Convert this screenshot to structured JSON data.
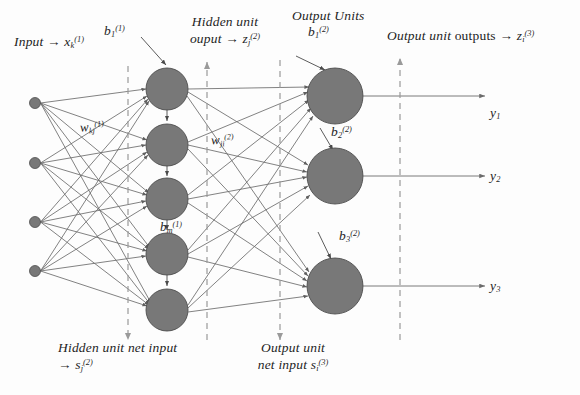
{
  "diagram": {
    "colors": {
      "node_fill": "#787878",
      "node_stroke": "#4d4d4d",
      "edge": "#6b6b6b",
      "dashed_guide": "#9a9a9a",
      "text": "#1d1d1d",
      "background": "#fdfdfd"
    },
    "labels": {
      "input": {
        "text_plain": "Input → x",
        "lead": "Input",
        "arrow": "→",
        "symbol": "x",
        "sub": "k",
        "sup": "(1)"
      },
      "hidden_bias_first": {
        "symbol": "b",
        "sub": "1",
        "sup": "(1)"
      },
      "hidden_bias_last": {
        "symbol": "b",
        "sub": "m",
        "sup": "(1)"
      },
      "hidden_output": {
        "line1": "Hidden unit",
        "line2_lead": "ouput",
        "arrow": "→",
        "symbol": "z",
        "sub": "j",
        "sup": "(2)"
      },
      "weights_input_hidden": {
        "symbol": "w",
        "sub": "kj",
        "sup": "(1)"
      },
      "weights_hidden_output": {
        "symbol": "w",
        "sub": "ji",
        "sup": "(2)"
      },
      "output_units_heading": "Output Units",
      "output_bias_1": {
        "symbol": "b",
        "sub": "1",
        "sup": "(2)"
      },
      "output_bias_2": {
        "symbol": "b",
        "sub": "2",
        "sup": "(2)"
      },
      "output_bias_3": {
        "symbol": "b",
        "sub": "3",
        "sup": "(2)"
      },
      "output_unit_outputs": {
        "lead": "Output unit",
        "word": "outputs",
        "arrow": "→",
        "symbol": "z",
        "sub": "i",
        "sup": "(3)"
      },
      "hidden_net_input": {
        "line1": "Hidden unit net input",
        "arrow": "→",
        "symbol": "s",
        "sub": "j",
        "sup": "(2)"
      },
      "output_net_input": {
        "line1": "Output unit",
        "line2": "net input",
        "symbol": "s",
        "sub": "i",
        "sup": "(3)"
      },
      "y1": {
        "symbol": "y",
        "sub": "1"
      },
      "y2": {
        "symbol": "y",
        "sub": "2"
      },
      "y3": {
        "symbol": "y",
        "sub": "3"
      }
    },
    "layers": {
      "input": {
        "name": "input-layer",
        "count": 4,
        "radius": 5.5,
        "x": 35,
        "ys": [
          103,
          163,
          222,
          271
        ]
      },
      "hidden": {
        "name": "hidden-layer",
        "count": 5,
        "radius": 21,
        "x": 167,
        "ys": [
          89,
          145,
          199,
          254,
          310
        ]
      },
      "output": {
        "name": "output-layer",
        "count": 3,
        "radius": 28,
        "x": 335,
        "ys": [
          96,
          176,
          286
        ]
      }
    },
    "guides": {
      "count": 4,
      "items": [
        {
          "name": "guide-hidden-net-input",
          "x": 128,
          "y_top": 66,
          "y_bottom": 340,
          "arrow": "down"
        },
        {
          "name": "guide-hidden-output",
          "x": 207,
          "y_top": 62,
          "y_bottom": 340,
          "arrow": "up"
        },
        {
          "name": "guide-output-net-input",
          "x": 280,
          "y_top": 60,
          "y_bottom": 340,
          "arrow": "down"
        },
        {
          "name": "guide-output-unit-outputs",
          "x": 400,
          "y_top": 58,
          "y_bottom": 340,
          "arrow": "up"
        }
      ]
    },
    "output_arrows": [
      {
        "name": "output-arrow-y1",
        "x_start": 363,
        "x_end": 485,
        "y": 96
      },
      {
        "name": "output-arrow-y2",
        "x_start": 363,
        "x_end": 485,
        "y": 176
      },
      {
        "name": "output-arrow-y3",
        "x_start": 363,
        "x_end": 485,
        "y": 286
      }
    ]
  }
}
